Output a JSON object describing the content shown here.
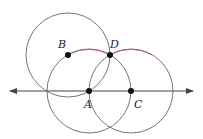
{
  "diagram": {
    "type": "geometric-construction",
    "line": {
      "x1": 10,
      "y1": 91,
      "x2": 193,
      "y2": 91,
      "arrows": "both"
    },
    "circles": [
      {
        "name": "circle-B",
        "center": "B",
        "cx": 68,
        "cy": 55,
        "r": 42
      },
      {
        "name": "circle-A",
        "center": "A",
        "cx": 89,
        "cy": 91,
        "r": 42
      },
      {
        "name": "circle-C",
        "center": "C",
        "cx": 131,
        "cy": 91,
        "r": 42
      }
    ],
    "arc": {
      "from": "B",
      "to": "D",
      "color": "#c0504d"
    },
    "points": [
      {
        "label": "A",
        "x": 89,
        "y": 91,
        "lx": 84,
        "ly": 108
      },
      {
        "label": "B",
        "x": 68,
        "y": 55,
        "lx": 58,
        "ly": 48
      },
      {
        "label": "C",
        "x": 131,
        "y": 91,
        "lx": 134,
        "ly": 108
      },
      {
        "label": "D",
        "x": 110,
        "y": 55,
        "lx": 110,
        "ly": 48
      }
    ]
  },
  "labels": {
    "A": "A",
    "B": "B",
    "C": "C",
    "D": "D"
  }
}
